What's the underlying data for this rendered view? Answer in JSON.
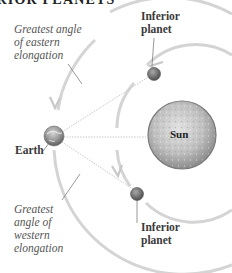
{
  "title_visible": "ERIOR PLANETS",
  "labels": {
    "eastern_elongation": "Greatest angle\nof eastern\nelongation",
    "western_elongation": "Greatest\nangle of\nwestern\nelongation",
    "inferior_planet_top": "Inferior\nplanet",
    "inferior_planet_bottom": "Inferior\nplanet",
    "earth": "Earth",
    "sun": "Sun"
  },
  "bodies": [
    {
      "name": "Earth",
      "icon": "earth-icon"
    },
    {
      "name": "Sun",
      "icon": "sun-icon"
    },
    {
      "name": "Inferior planet (eastern elongation)",
      "icon": "planet-icon"
    },
    {
      "name": "Inferior planet (western elongation)",
      "icon": "planet-icon"
    }
  ],
  "colors": {
    "orbit": "#d4d4d4",
    "leader_line": "#8a8a8a",
    "sightline": "#c8c8c8",
    "sun_fill": "#b9b9b9",
    "planet_fill": "#7a7a7a"
  }
}
